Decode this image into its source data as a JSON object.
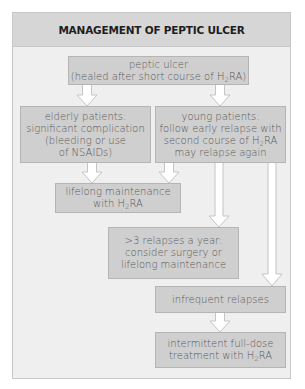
{
  "diagram": {
    "title": "MANAGEMENT OF PEPTIC ULCER",
    "colors": {
      "frame_bg": "#efefef",
      "title_bg": "#d6d6d6",
      "box_bg": "#cfcfcf",
      "box_text": "#585858",
      "title_text": "#1e1e1e",
      "arrow_fill": "#ffffff"
    },
    "nodes": [
      {
        "id": "peptic-ulcer",
        "line1": "peptic ulcer",
        "line2_pre": "(healed after short course of H",
        "sub": "2",
        "line2_post": "RA)"
      },
      {
        "id": "elderly",
        "text": "elderly patients:\nsignificant complication\n(bleeding or use\nof NSAIDs)"
      },
      {
        "id": "young",
        "line1": "young patients:",
        "line2": "follow early relapse with",
        "line3_pre": "second course of H",
        "sub": "2",
        "line3_post": "RA",
        "line4": "may relapse again"
      },
      {
        "id": "lifelong",
        "line1": "lifelong maintenance",
        "line2_pre": "with H",
        "sub": "2",
        "line2_post": "RA"
      },
      {
        "id": "frequent",
        "text": ">3 relapses a year:\nconsider surgery or\nlifelong maintenance"
      },
      {
        "id": "infrequent",
        "text": "infrequent relapses"
      },
      {
        "id": "intermittent",
        "line1": "intermittent full-dose",
        "line2_pre": "treatment with H",
        "sub": "2",
        "line2_post": "RA"
      }
    ],
    "edges": [
      {
        "from": "peptic-ulcer",
        "to": "elderly"
      },
      {
        "from": "peptic-ulcer",
        "to": "young"
      },
      {
        "from": "elderly",
        "to": "lifelong"
      },
      {
        "from": "young",
        "to": "lifelong"
      },
      {
        "from": "young",
        "to": "frequent"
      },
      {
        "from": "young",
        "to": "infrequent"
      },
      {
        "from": "infrequent",
        "to": "intermittent"
      }
    ]
  }
}
